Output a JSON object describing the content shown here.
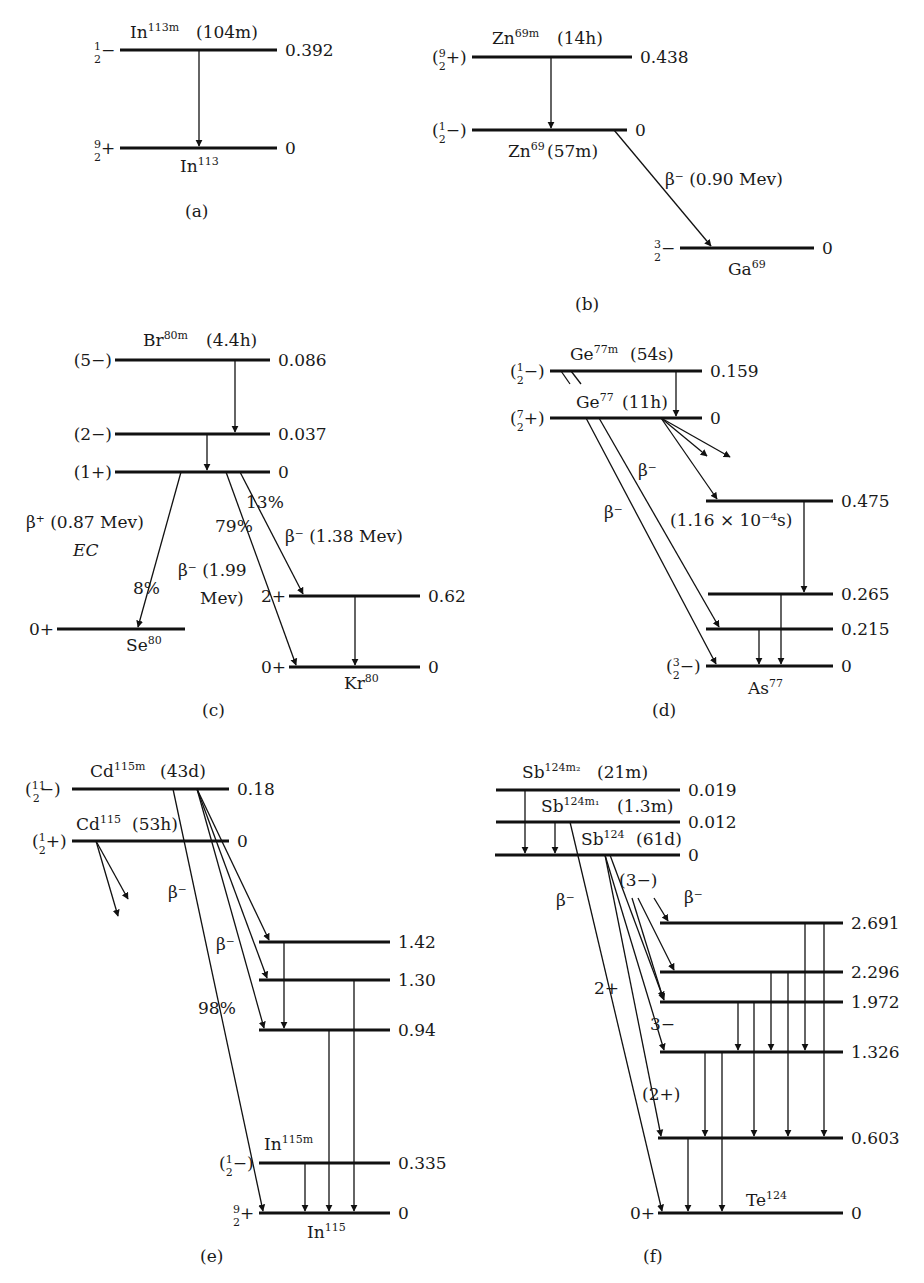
{
  "figure": {
    "panels": [
      {
        "id": "a",
        "caption": "(a)",
        "parents": [
          {
            "name": "In",
            "mass": "113",
            "suffix": "m",
            "halflife": "(104m)"
          }
        ],
        "levels": [
          {
            "x1": 120,
            "x2": 277,
            "y": 50,
            "energy": "0.392",
            "spin": "½−"
          },
          {
            "x1": 120,
            "x2": 277,
            "y": 148,
            "energy": "0",
            "spin": "9/2+"
          }
        ],
        "labels": [
          {
            "text": "In",
            "sup": "113m",
            "x": 130,
            "y": 38
          },
          {
            "text": "(104m)",
            "x": 196,
            "y": 38
          },
          {
            "text": "In",
            "sup": "113",
            "x": 180,
            "y": 172
          }
        ],
        "transitions": [
          {
            "x1": 199,
            "y1": 50,
            "x2": 199,
            "y2": 146
          }
        ]
      },
      {
        "id": "b",
        "caption": "(b)",
        "levels": [
          {
            "x1": 472,
            "x2": 632,
            "y": 57,
            "energy": "0.438",
            "spin": "(9/2+)"
          },
          {
            "x1": 472,
            "x2": 627,
            "y": 130,
            "energy": "0",
            "spin": "(½−)"
          },
          {
            "x1": 680,
            "x2": 814,
            "y": 248,
            "energy": "0",
            "spin": "3/2−"
          }
        ],
        "labels": [
          {
            "text": "Zn",
            "sup": "69m",
            "x": 492,
            "y": 44
          },
          {
            "text": "(14h)",
            "x": 557,
            "y": 44
          },
          {
            "text": "Zn",
            "sup": "69",
            "x": 508,
            "y": 157
          },
          {
            "text": "(57m)",
            "x": 547,
            "y": 157
          },
          {
            "text": "β⁻  (0.90  Mev)",
            "x": 665,
            "y": 185,
            "italicFirst": true
          },
          {
            "text": "Ga",
            "sup": "69",
            "x": 728,
            "y": 275
          }
        ],
        "transitions": [
          {
            "x1": 551,
            "y1": 57,
            "x2": 551,
            "y2": 128
          },
          {
            "x1": 614,
            "y1": 130,
            "x2": 711,
            "y2": 246
          }
        ]
      },
      {
        "id": "c",
        "caption": "(c)",
        "levels": [
          {
            "x1": 115,
            "x2": 270,
            "y": 360,
            "energy": "0.086",
            "spin": "(5−)"
          },
          {
            "x1": 115,
            "x2": 270,
            "y": 434,
            "energy": "0.037",
            "spin": "(2−)"
          },
          {
            "x1": 115,
            "x2": 270,
            "y": 472,
            "energy": "0",
            "spin": "(1+)"
          },
          {
            "x1": 57,
            "x2": 185,
            "y": 629,
            "energy": "",
            "spin": "0+"
          },
          {
            "x1": 289,
            "x2": 420,
            "y": 596,
            "energy": "0.62",
            "spin": "2+"
          },
          {
            "x1": 289,
            "x2": 420,
            "y": 667,
            "energy": "0",
            "spin": "0+"
          }
        ],
        "labels": [
          {
            "text": "Br",
            "sup": "80m",
            "x": 143,
            "y": 346
          },
          {
            "text": "(4.4h)",
            "x": 206,
            "y": 346
          },
          {
            "text": "13%",
            "x": 246,
            "y": 508
          },
          {
            "text": "β⁺ (0.87 Mev)",
            "x": 26,
            "y": 528
          },
          {
            "text": "EC",
            "x": 73,
            "y": 556,
            "italic": true
          },
          {
            "text": "79%",
            "x": 215,
            "y": 532
          },
          {
            "text": "β⁻  (1.38  Mev)",
            "x": 285,
            "y": 542
          },
          {
            "text": "β⁻  (1.99",
            "x": 178,
            "y": 576
          },
          {
            "text": "Mev)",
            "x": 200,
            "y": 604
          },
          {
            "text": "8%",
            "x": 133,
            "y": 594
          },
          {
            "text": "Se",
            "sup": "80",
            "x": 126,
            "y": 651
          },
          {
            "text": "Kr",
            "sup": "80",
            "x": 344,
            "y": 689
          }
        ],
        "transitions": [
          {
            "x1": 235,
            "y1": 360,
            "x2": 235,
            "y2": 432
          },
          {
            "x1": 207,
            "y1": 434,
            "x2": 207,
            "y2": 470
          },
          {
            "x1": 181,
            "y1": 472,
            "x2": 138,
            "y2": 627
          },
          {
            "x1": 240,
            "y1": 472,
            "x2": 303,
            "y2": 594
          },
          {
            "x1": 226,
            "y1": 472,
            "x2": 296,
            "y2": 665
          },
          {
            "x1": 355,
            "y1": 596,
            "x2": 355,
            "y2": 665
          }
        ]
      },
      {
        "id": "d",
        "caption": "(d)",
        "levels": [
          {
            "x1": 550,
            "x2": 702,
            "y": 371,
            "energy": "0.159",
            "spin": "(½−)"
          },
          {
            "x1": 550,
            "x2": 702,
            "y": 418,
            "energy": "0",
            "spin": "(7/2+)"
          },
          {
            "x1": 706,
            "x2": 833,
            "y": 501,
            "energy": "0.475",
            "spin": ""
          },
          {
            "x1": 708,
            "x2": 833,
            "y": 594,
            "energy": "0.265",
            "spin": ""
          },
          {
            "x1": 706,
            "x2": 833,
            "y": 629,
            "energy": "0.215",
            "spin": ""
          },
          {
            "x1": 706,
            "x2": 833,
            "y": 666,
            "energy": "0",
            "spin": "(3/2−)"
          }
        ],
        "labels": [
          {
            "text": "Ge",
            "sup": "77m",
            "x": 570,
            "y": 360
          },
          {
            "text": "(54s)",
            "x": 630,
            "y": 360
          },
          {
            "text": "Ge",
            "sup": "77",
            "x": 576,
            "y": 408
          },
          {
            "text": "(11h)",
            "x": 622,
            "y": 408
          },
          {
            "text": "β⁻",
            "x": 638,
            "y": 476
          },
          {
            "text": "(1.16 × 10⁻⁴s)",
            "x": 670,
            "y": 526
          },
          {
            "text": "β⁻",
            "x": 604,
            "y": 518
          },
          {
            "text": "As",
            "sup": "77",
            "x": 748,
            "y": 694
          }
        ],
        "transitions": [
          {
            "x1": 676,
            "y1": 371,
            "x2": 676,
            "y2": 416
          },
          {
            "x1": 661,
            "y1": 418,
            "x2": 717,
            "y2": 499
          },
          {
            "x1": 661,
            "y1": 418,
            "x2": 707,
            "y2": 456,
            "open": true
          },
          {
            "x1": 661,
            "y1": 418,
            "x2": 730,
            "y2": 457,
            "open": true
          },
          {
            "x1": 586,
            "y1": 418,
            "x2": 716,
            "y2": 664
          },
          {
            "x1": 599,
            "y1": 418,
            "x2": 719,
            "y2": 627
          },
          {
            "x1": 804,
            "y1": 501,
            "x2": 804,
            "y2": 592
          },
          {
            "x1": 781,
            "y1": 594,
            "x2": 781,
            "y2": 664
          },
          {
            "x1": 759,
            "y1": 629,
            "x2": 759,
            "y2": 664
          }
        ],
        "ticks": [
          {
            "x1": 561,
            "y1": 371,
            "x2": 570,
            "y2": 384
          },
          {
            "x1": 571,
            "y1": 371,
            "x2": 581,
            "y2": 384
          }
        ]
      },
      {
        "id": "e",
        "caption": "(e)",
        "levels": [
          {
            "x1": 72,
            "x2": 229,
            "y": 789,
            "energy": "0.18",
            "spin": "(11/2−)"
          },
          {
            "x1": 72,
            "x2": 229,
            "y": 841,
            "energy": "0",
            "spin": "(½+)"
          },
          {
            "x1": 259,
            "x2": 390,
            "y": 942,
            "energy": "1.42",
            "spin": ""
          },
          {
            "x1": 259,
            "x2": 390,
            "y": 980,
            "energy": "1.30",
            "spin": ""
          },
          {
            "x1": 259,
            "x2": 390,
            "y": 1030,
            "energy": "0.94",
            "spin": ""
          },
          {
            "x1": 259,
            "x2": 390,
            "y": 1163,
            "energy": "0.335",
            "spin": "(½−)"
          },
          {
            "x1": 259,
            "x2": 390,
            "y": 1213,
            "energy": "0",
            "spin": "9/2+"
          }
        ],
        "labels": [
          {
            "text": "Cd",
            "sup": "115m",
            "x": 90,
            "y": 777
          },
          {
            "text": "(43d)",
            "x": 160,
            "y": 777
          },
          {
            "text": "Cd",
            "sup": "115",
            "x": 76,
            "y": 830
          },
          {
            "text": "(53h)",
            "x": 132,
            "y": 830
          },
          {
            "text": "β⁻",
            "x": 168,
            "y": 898
          },
          {
            "text": "β⁻",
            "x": 216,
            "y": 950
          },
          {
            "text": "98%",
            "x": 198,
            "y": 1014
          },
          {
            "text": "In",
            "sup": "115m",
            "x": 264,
            "y": 1150
          },
          {
            "text": "In",
            "sup": "115",
            "x": 307,
            "y": 1238
          }
        ],
        "transitions": [
          {
            "x1": 96,
            "y1": 841,
            "x2": 128,
            "y2": 899,
            "open": true
          },
          {
            "x1": 96,
            "y1": 841,
            "x2": 118,
            "y2": 916,
            "open": true
          },
          {
            "x1": 173,
            "y1": 789,
            "x2": 263,
            "y2": 1211
          },
          {
            "x1": 197,
            "y1": 789,
            "x2": 269,
            "y2": 940
          },
          {
            "x1": 197,
            "y1": 789,
            "x2": 267,
            "y2": 978
          },
          {
            "x1": 197,
            "y1": 789,
            "x2": 264,
            "y2": 1028
          },
          {
            "x1": 284,
            "y1": 942,
            "x2": 284,
            "y2": 1028
          },
          {
            "x1": 354,
            "y1": 980,
            "x2": 354,
            "y2": 1211
          },
          {
            "x1": 329,
            "y1": 1030,
            "x2": 329,
            "y2": 1211
          },
          {
            "x1": 305,
            "y1": 1163,
            "x2": 305,
            "y2": 1211
          }
        ]
      },
      {
        "id": "f",
        "caption": "(f)",
        "levels": [
          {
            "x1": 496,
            "x2": 680,
            "y": 790,
            "energy": "0.019",
            "spin": ""
          },
          {
            "x1": 496,
            "x2": 680,
            "y": 822,
            "energy": "0.012",
            "spin": ""
          },
          {
            "x1": 495,
            "x2": 680,
            "y": 855,
            "energy": "0",
            "spin": ""
          },
          {
            "x1": 660,
            "x2": 843,
            "y": 923,
            "energy": "2.691",
            "spin": ""
          },
          {
            "x1": 660,
            "x2": 843,
            "y": 972,
            "energy": "2.296",
            "spin": ""
          },
          {
            "x1": 660,
            "x2": 843,
            "y": 1002,
            "energy": "1.972",
            "spin": ""
          },
          {
            "x1": 660,
            "x2": 843,
            "y": 1052,
            "energy": "1.326",
            "spin": ""
          },
          {
            "x1": 658,
            "x2": 843,
            "y": 1138,
            "energy": "0.603",
            "spin": ""
          },
          {
            "x1": 658,
            "x2": 843,
            "y": 1213,
            "energy": "0",
            "spin": "0+"
          }
        ],
        "labels": [
          {
            "text": "Sb",
            "sup": "124m₂",
            "x": 522,
            "y": 778
          },
          {
            "text": "(21m)",
            "x": 597,
            "y": 778
          },
          {
            "text": "Sb",
            "sup": "124m₁",
            "x": 541,
            "y": 812
          },
          {
            "text": "(1.3m)",
            "x": 617,
            "y": 812
          },
          {
            "text": "Sb",
            "sup": "124",
            "x": 581,
            "y": 845
          },
          {
            "text": "(61d)",
            "x": 636,
            "y": 845
          },
          {
            "text": "(3−)",
            "x": 619,
            "y": 886
          },
          {
            "text": "β⁻",
            "x": 684,
            "y": 903
          },
          {
            "text": "β⁻",
            "x": 556,
            "y": 906
          },
          {
            "text": "2+",
            "x": 594,
            "y": 994
          },
          {
            "text": "3−",
            "x": 650,
            "y": 1030
          },
          {
            "text": "(2+)",
            "x": 642,
            "y": 1100
          },
          {
            "text": "Te",
            "sup": "124",
            "x": 746,
            "y": 1206
          }
        ],
        "transitions": [
          {
            "x1": 525,
            "y1": 790,
            "x2": 525,
            "y2": 853
          },
          {
            "x1": 555,
            "y1": 822,
            "x2": 555,
            "y2": 853
          },
          {
            "x1": 570,
            "y1": 822,
            "x2": 662,
            "y2": 1211
          },
          {
            "x1": 605,
            "y1": 855,
            "x2": 661,
            "y2": 1136
          },
          {
            "x1": 605,
            "y1": 855,
            "x2": 664,
            "y2": 1050
          },
          {
            "x1": 610,
            "y1": 855,
            "x2": 664,
            "y2": 1000
          },
          {
            "x1": 632,
            "y1": 898,
            "x2": 663,
            "y2": 998
          },
          {
            "x1": 638,
            "y1": 898,
            "x2": 674,
            "y2": 970
          },
          {
            "x1": 654,
            "y1": 898,
            "x2": 668,
            "y2": 921
          },
          {
            "x1": 805,
            "y1": 923,
            "x2": 805,
            "y2": 1050
          },
          {
            "x1": 824,
            "y1": 923,
            "x2": 824,
            "y2": 1136
          },
          {
            "x1": 771,
            "y1": 972,
            "x2": 771,
            "y2": 1050
          },
          {
            "x1": 788,
            "y1": 972,
            "x2": 788,
            "y2": 1136
          },
          {
            "x1": 738,
            "y1": 1002,
            "x2": 738,
            "y2": 1050
          },
          {
            "x1": 754,
            "y1": 1002,
            "x2": 754,
            "y2": 1136
          },
          {
            "x1": 705,
            "y1": 1052,
            "x2": 705,
            "y2": 1136
          },
          {
            "x1": 722,
            "y1": 1052,
            "x2": 722,
            "y2": 1211
          },
          {
            "x1": 688,
            "y1": 1138,
            "x2": 688,
            "y2": 1211
          }
        ]
      }
    ],
    "captions": [
      {
        "text": "(a)",
        "x": 185,
        "y": 217
      },
      {
        "text": "(b)",
        "x": 575,
        "y": 310
      },
      {
        "text": "(c)",
        "x": 202,
        "y": 716
      },
      {
        "text": "(d)",
        "x": 652,
        "y": 716
      },
      {
        "text": "(e)",
        "x": 200,
        "y": 1262
      },
      {
        "text": "(f)",
        "x": 643,
        "y": 1262
      }
    ]
  }
}
